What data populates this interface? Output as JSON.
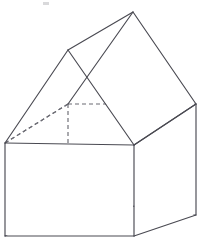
{
  "figure": {
    "title": "House-shaped solid (cuboid with triangular prism roof)",
    "projection": "oblique",
    "background_color": "#ffffff",
    "solid_edge_color": "#4a4a52",
    "hidden_edge_color": "#6b6b73",
    "stroke_width": 1.15,
    "hidden_dash_pattern": "4 3",
    "canvas": {
      "width": 205,
      "height": 243
    },
    "vertices": {
      "front_top_left": [
        5,
        143
      ],
      "front_top_right": [
        134,
        145
      ],
      "front_bottom_right": [
        134,
        236
      ],
      "front_bottom_left": [
        5,
        236
      ],
      "back_top_left": [
        68,
        104
      ],
      "back_top_right": [
        196,
        104
      ],
      "back_bottom_right": [
        196,
        215
      ],
      "back_bottom_left": [
        68,
        197
      ],
      "ridge_front": [
        68,
        50
      ],
      "ridge_back": [
        133,
        12
      ]
    },
    "edges": [
      {
        "name": "front-face-top",
        "from": "front_top_left",
        "to": "front_top_right",
        "style": "solid"
      },
      {
        "name": "front-face-right",
        "from": "front_top_right",
        "to": "front_bottom_right",
        "style": "solid"
      },
      {
        "name": "front-face-bottom",
        "from": "front_bottom_right",
        "to": "front_bottom_left",
        "style": "solid"
      },
      {
        "name": "front-face-left",
        "from": "front_bottom_left",
        "to": "front_top_left",
        "style": "solid"
      },
      {
        "name": "right-face-top",
        "from": "front_top_right",
        "to": "back_top_right",
        "style": "solid"
      },
      {
        "name": "right-face-bottom",
        "from": "front_bottom_right",
        "to": "back_bottom_right",
        "style": "solid"
      },
      {
        "name": "right-face-back-vertical",
        "from": "back_top_right",
        "to": "back_bottom_right",
        "style": "solid"
      },
      {
        "name": "back-top-edge",
        "from": "back_top_left",
        "to": "back_top_right",
        "style": "hidden"
      },
      {
        "name": "back-bottom-edge",
        "from": "back_bottom_left",
        "to": "back_bottom_right",
        "style": "hidden"
      },
      {
        "name": "back-left-vertical",
        "from": "back_top_left",
        "to": "back_bottom_left",
        "style": "hidden"
      },
      {
        "name": "left-face-top-depth",
        "from": "front_top_left",
        "to": "back_top_left",
        "style": "hidden"
      },
      {
        "name": "left-face-bottom-depth",
        "from": "front_bottom_left",
        "to": "back_bottom_left",
        "style": "hidden"
      },
      {
        "name": "roof-gable-front-left",
        "from": "front_top_left",
        "to": "ridge_front",
        "style": "solid"
      },
      {
        "name": "roof-gable-front-right",
        "from": "ridge_front",
        "to": "front_top_right",
        "style": "solid"
      },
      {
        "name": "roof-ridge",
        "from": "ridge_front",
        "to": "ridge_back",
        "style": "solid"
      },
      {
        "name": "roof-hip-back-left",
        "from": "back_top_left",
        "to": "ridge_back",
        "style": "solid"
      },
      {
        "name": "roof-hip-back-right",
        "from": "ridge_back",
        "to": "back_top_right",
        "style": "solid"
      },
      {
        "name": "roof-eave-right",
        "from": "front_top_right",
        "to": "back_top_right",
        "style": "solid"
      },
      {
        "name": "roof-eave-left",
        "from": "front_top_left",
        "to": "back_top_left",
        "style": "hidden"
      }
    ],
    "speck": {
      "x": 43,
      "y": 2,
      "width": 6,
      "height": 3
    }
  }
}
